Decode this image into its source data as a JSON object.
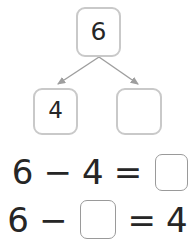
{
  "worksheet": {
    "title": "Number bond subtraction worksheet",
    "colors": {
      "background": "#ffffff",
      "digit": "#262626",
      "bond_box_border": "#c9c9c9",
      "blank_box_border": "#9a9a9a",
      "arrow": "#9e9e9e"
    }
  },
  "number_bond": {
    "whole": {
      "label": "6",
      "filled": true
    },
    "parts": [
      {
        "label": "4",
        "filled": true
      },
      {
        "label": "",
        "filled": false
      }
    ],
    "arrows": [
      {
        "name": "arrow-to-left-part",
        "from": [
          99,
          57
        ],
        "to": [
          56,
          85
        ]
      },
      {
        "name": "arrow-to-right-part",
        "from": [
          99,
          57
        ],
        "to": [
          139,
          85
        ]
      }
    ]
  },
  "equations": [
    {
      "id": "equation-1",
      "minuend": "6",
      "operator": "−",
      "subtrahend": "4",
      "equals": "=",
      "answer": "",
      "answer_is_blank": true
    },
    {
      "id": "equation-2",
      "minuend": "6",
      "operator": "−",
      "subtrahend": "",
      "subtrahend_is_blank": true,
      "equals": "=",
      "answer": "4"
    }
  ]
}
